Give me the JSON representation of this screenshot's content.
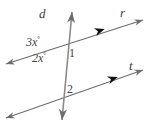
{
  "figure": {
    "type": "geometry-diagram",
    "width": 147,
    "height": 128,
    "background_color": "#ffffff",
    "stroke_color": "#6e6e6e",
    "marker_color": "#1a1a1a",
    "text_color": "#444444",
    "labels": {
      "transversal_line": "d",
      "parallel_line_top": "r",
      "parallel_line_bottom": "t",
      "angle_expr_upper_left": "3x",
      "angle_expr_upper_left_unit": "°",
      "angle_expr_lower_left": "2x",
      "angle_expr_lower_left_unit": "°",
      "angle_number_one": "1",
      "angle_number_two": "2"
    },
    "geometry": {
      "line_d": {
        "x1": 72,
        "y1": 12,
        "x2": 62,
        "y2": 120,
        "arrows": "both"
      },
      "line_r": {
        "x1": 6,
        "y1": 64,
        "x2": 143,
        "y2": 20,
        "arrows": "both",
        "parallel_marker_at": [
          100,
          31
        ]
      },
      "line_t": {
        "x1": 6,
        "y1": 118,
        "x2": 143,
        "y2": 70,
        "arrows": "both",
        "parallel_marker_at": [
          113,
          79
        ]
      },
      "intersection_r_d": [
        66,
        48
      ],
      "intersection_t_d": [
        64,
        96
      ]
    }
  }
}
